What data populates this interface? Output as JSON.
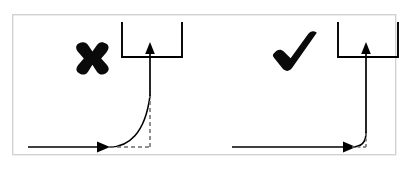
{
  "figure": {
    "title": "",
    "background_color": "#ffffff",
    "frame": {
      "border_color": "#d2d2d2",
      "x": 12,
      "y": 14,
      "width": 384,
      "height": 141
    },
    "ink_color": "#000000",
    "dash_color": "#6b6b6b"
  },
  "panels": [
    {
      "id": "incorrect",
      "mark_name": "cross-mark",
      "mark_label": "✖",
      "mark_meaning": "incorrect",
      "mark_x": 92,
      "mark_y": 55,
      "mark_size": 30,
      "description": "Gradual wide-radius curve transitioning from horizontal flow to vertical flow",
      "curve_style": "gradual",
      "baseline_y": 147,
      "horizontal_start_x": 28,
      "arrow_x": 98,
      "riser_x": 150,
      "curve_start_x": 110,
      "curve_top_y": 96,
      "container": {
        "name": "open-top-container",
        "left_x": 122,
        "right_x": 182,
        "top_y": 22,
        "bottom_y": 57
      },
      "asymptote": {
        "horizontal_from_x": 110,
        "horizontal_to_x": 150,
        "vertical_from_y": 96,
        "vertical_to_y": 147,
        "dash_pattern": "4 3"
      }
    },
    {
      "id": "correct",
      "mark_name": "check-mark",
      "mark_label": "✔",
      "mark_meaning": "correct",
      "mark_x": 295,
      "mark_y": 52,
      "mark_size": 32,
      "description": "Tight small-radius corner transitioning from horizontal flow to vertical flow",
      "curve_style": "tight",
      "baseline_y": 147,
      "horizontal_start_x": 232,
      "arrow_x": 344,
      "riser_x": 366,
      "curve_start_x": 352,
      "curve_top_y": 133,
      "container": {
        "name": "open-top-container",
        "left_x": 338,
        "right_x": 398,
        "top_y": 22,
        "bottom_y": 57
      },
      "asymptote": {
        "horizontal_from_x": 352,
        "horizontal_to_x": 366,
        "vertical_from_y": 133,
        "vertical_to_y": 147,
        "dash_pattern": "3 2.5"
      }
    }
  ]
}
